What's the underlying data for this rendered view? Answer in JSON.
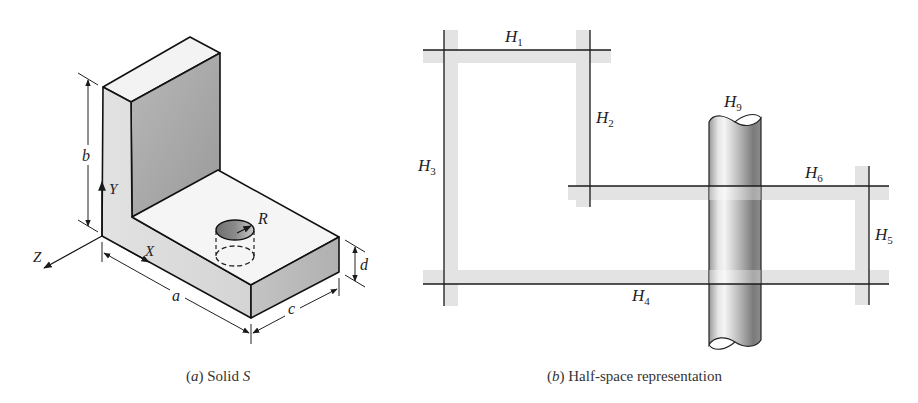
{
  "figure_a": {
    "caption_prefix": "(",
    "caption_letter": "a",
    "caption_text": ") Solid ",
    "caption_symbol": "S",
    "dimensions": {
      "a": "a",
      "b": "b",
      "c": "c",
      "d": "d",
      "R": "R"
    },
    "axes": {
      "x": "X",
      "y": "Y",
      "z": "Z"
    }
  },
  "figure_b": {
    "caption_prefix": "(",
    "caption_letter": "b",
    "caption_text": ") Half-space representation",
    "halfspaces": [
      {
        "name": "H",
        "sub": "1"
      },
      {
        "name": "H",
        "sub": "2"
      },
      {
        "name": "H",
        "sub": "3"
      },
      {
        "name": "H",
        "sub": "4"
      },
      {
        "name": "H",
        "sub": "5"
      },
      {
        "name": "H",
        "sub": "6"
      },
      {
        "name": "H",
        "sub": "9"
      }
    ]
  },
  "colors": {
    "line": "#1a1a1a",
    "shade": "#e4e4e4",
    "face_light": "#f4f4f4",
    "face_side": "#dcdcdc",
    "face_dark": "#a8a8a8"
  }
}
